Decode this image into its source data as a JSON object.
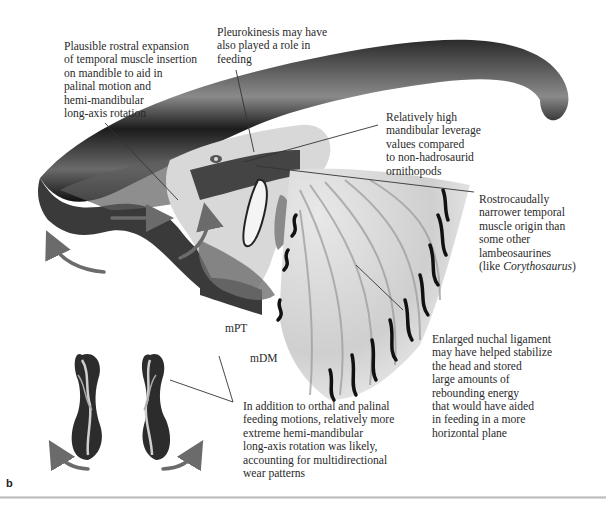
{
  "figure": {
    "panel_label": "b",
    "annotations": [
      {
        "id": "rostral-expansion",
        "text": "Plausible rostral expansion\nof temporal muscle insertion\non mandible to aid in\npalinal motion and\nhemi-mandibular\nlong-axis rotation"
      },
      {
        "id": "pleurokinesis",
        "text": "Pleurokinesis may have\nalso played a role in\nfeeding"
      },
      {
        "id": "mandibular-leverage",
        "text": "Relatively high\nmandibular leverage\nvalues compared\nto non-hadrosaurid\nornithopods"
      },
      {
        "id": "temporal-origin",
        "text_before_italic": "Rostrocaudally\nnarrower temporal\nmuscle origin than\nsome other\nlambeosaurines\n(like ",
        "italic": "Corythosaurus",
        "text_after_italic": ")"
      },
      {
        "id": "nuchal-ligament",
        "text": "Enlarged nuchal ligament\nmay have helped stabilize\nthe head and stored\nlarge amounts of\nrebounding energy\nthat would have aided\nin feeding in a more\nhorizontal plane"
      },
      {
        "id": "hemi-mandibular-rotation",
        "text": "In addition to orthal and palinal\nfeeding motions, relatively more\nextreme hemi-mandibular\nlong-axis rotation was likely,\naccounting for multidirectional\nwear patterns"
      }
    ],
    "muscle_labels": [
      {
        "id": "mPT",
        "text": "mPT"
      },
      {
        "id": "mDM",
        "text": "mDM"
      }
    ],
    "colors": {
      "arrow": "#6b6b6b",
      "text": "#2a2a2a",
      "leader_line": "#333333",
      "bone_dark": "#1a1a1a"
    }
  }
}
